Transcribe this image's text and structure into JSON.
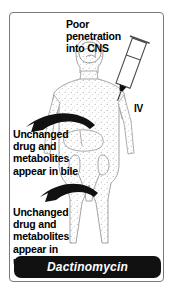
{
  "card": {
    "title_note": "Dactinomycin pharmacokinetics diagram",
    "border_color": "#7a7a7a",
    "background_color": "#ffffff"
  },
  "annotations": {
    "cns": {
      "lines": [
        "Poor",
        "penetration",
        "into CNS"
      ],
      "text": "Poor\npenetration\ninto CNS"
    },
    "bile": {
      "lines": [
        "Unchanged",
        "drug and",
        "metabolites",
        "appear in bile"
      ],
      "text": "Unchanged\ndrug and\nmetabolites\nappear in bile"
    },
    "urine": {
      "lines": [
        "Unchanged",
        "drug and",
        "metabolites",
        "appear in",
        "urine"
      ],
      "text": "Unchanged\ndrug and\nmetabolites\nappear in\nurine"
    },
    "iv": {
      "label": "IV"
    }
  },
  "icons": {
    "syringe": "syringe-icon",
    "body": "human-body-icon",
    "brain": "brain-icon",
    "liver": "liver-icon",
    "kidney": "kidney-icon",
    "bile_arrow": "curved-arrow-left-icon",
    "urine_arrow": "curved-arrow-left-icon"
  },
  "footer": {
    "drug_name": "Dactinomycin",
    "background_color": "#111111",
    "text_color": "#ffffff"
  },
  "colors": {
    "ink": "#000000",
    "figure_outline": "#9a9a9a",
    "stipple": "#b0b0b0",
    "paper": "#ffffff"
  }
}
